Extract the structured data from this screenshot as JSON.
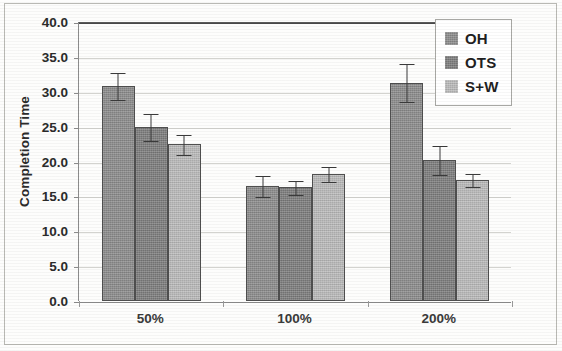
{
  "chart_data": {
    "type": "bar",
    "title": "",
    "subtitle": "",
    "xlabel": "",
    "ylabel": "Completion Time",
    "categories": [
      "50%",
      "100%",
      "200%"
    ],
    "ylim": [
      0.0,
      40.0
    ],
    "yticks": [
      "0.0",
      "5.0",
      "10.0",
      "15.0",
      "20.0",
      "25.0",
      "30.0",
      "35.0",
      "40.0"
    ],
    "ytick_values": [
      0,
      5,
      10,
      15,
      20,
      25,
      30,
      35,
      40
    ],
    "grid": true,
    "grid_axis": "y",
    "legend_position": "top-right",
    "error_bars": true,
    "series": [
      {
        "name": "OH",
        "color": "#8d8d8d",
        "values": [
          30.8,
          16.5,
          31.3
        ],
        "errors": [
          2.0,
          1.6,
          2.8
        ]
      },
      {
        "name": "OTS",
        "color": "#7e7e7e",
        "values": [
          25.0,
          16.3,
          20.2
        ],
        "errors": [
          2.0,
          1.1,
          2.1
        ]
      },
      {
        "name": "S+W",
        "color": "#bcbcbc",
        "values": [
          22.5,
          18.2,
          17.3
        ],
        "errors": [
          1.5,
          1.1,
          1.0
        ]
      }
    ]
  },
  "legend": {
    "items": [
      {
        "label": "OH",
        "swatch": "#8d8d8d"
      },
      {
        "label": "OTS",
        "swatch": "#7e7e7e"
      },
      {
        "label": "S+W",
        "swatch": "#bcbcbc"
      }
    ]
  },
  "axes": {
    "y_title": "Completion Time"
  },
  "colors": {
    "axis": "#8c8c8c",
    "grid": "#d3d3cf",
    "text": "#2b2b2b",
    "bar_outline": "#4f4f4f",
    "error_bar": "#3a3a3a"
  }
}
